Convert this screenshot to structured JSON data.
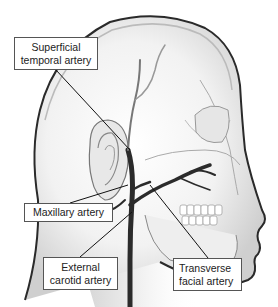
{
  "diagram": {
    "labels": [
      {
        "id": "superficial-temporal",
        "lines": [
          "Superficial",
          "temporal artery"
        ]
      },
      {
        "id": "maxillary",
        "lines": [
          "Maxillary artery"
        ]
      },
      {
        "id": "external-carotid",
        "lines": [
          "External",
          "carotid artery"
        ]
      },
      {
        "id": "transverse-facial",
        "lines": [
          "Transverse",
          "facial artery"
        ]
      }
    ]
  },
  "colors": {
    "background": "#ffffff",
    "outline": "#2a2a2a",
    "artery": "#2b2b2b",
    "skin_shade": "#d8d8d8",
    "label_border": "#555555"
  }
}
